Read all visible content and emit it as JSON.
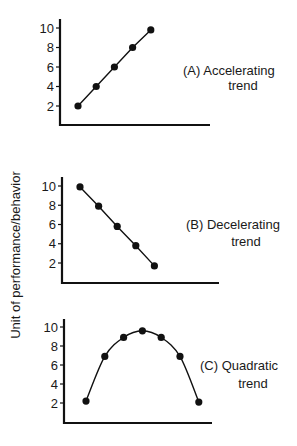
{
  "figure": {
    "shared_ylabel": "Unit of performance/behavior"
  },
  "chart_data": [
    {
      "type": "line",
      "panel": "A",
      "title": "(A) Accelerating trend",
      "label_line1": "(A)  Accelerating",
      "label_line2": "trend",
      "xlabel": "",
      "ylabel": "Unit of performance/behavior",
      "yticks": [
        2,
        4,
        6,
        8,
        10
      ],
      "ylim": [
        0,
        10.8
      ],
      "grid": false,
      "x": [
        1,
        2,
        3,
        4,
        5
      ],
      "values": [
        2,
        4,
        6,
        8,
        9.8
      ],
      "curve": "straight"
    },
    {
      "type": "line",
      "panel": "B",
      "title": "(B) Decelerating trend",
      "label_line1": "(B)  Decelerating",
      "label_line2": "trend",
      "xlabel": "",
      "ylabel": "Unit of performance/behavior",
      "yticks": [
        2,
        4,
        6,
        8,
        10
      ],
      "ylim": [
        0,
        10.8
      ],
      "grid": false,
      "x": [
        1,
        2,
        3,
        4,
        5
      ],
      "values": [
        9.9,
        7.9,
        5.8,
        3.8,
        1.7
      ],
      "curve": "straight"
    },
    {
      "type": "line",
      "panel": "C",
      "title": "(C) Quadratic trend",
      "label_line1": "(C)  Quadratic",
      "label_line2": "trend",
      "xlabel": "",
      "ylabel": "Unit of performance/behavior",
      "yticks": [
        2,
        4,
        6,
        8,
        10
      ],
      "ylim": [
        0,
        10.8
      ],
      "grid": false,
      "x": [
        1,
        2,
        3,
        4,
        5,
        6,
        7
      ],
      "values": [
        2.2,
        6.9,
        8.9,
        9.6,
        8.9,
        6.9,
        2.1
      ],
      "curve": "smooth"
    }
  ]
}
